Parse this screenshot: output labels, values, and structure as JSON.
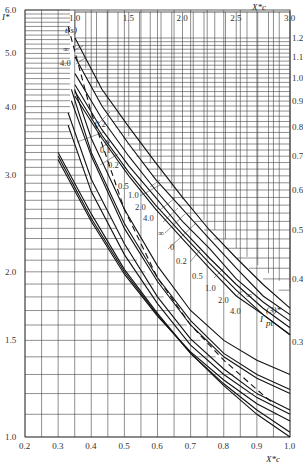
{
  "chart_data": {
    "type": "line",
    "title": "",
    "lower_left": {
      "xlabel": "X_c*",
      "ylabel": "I*",
      "xlim": [
        0.2,
        1.0
      ],
      "ylim": [
        1.0,
        6.0
      ],
      "xticks": [
        "0.2",
        "0.3",
        "0.4",
        "0.5",
        "0.6",
        "0.7",
        "0.8",
        "0.9",
        "1.0"
      ],
      "yticks": [
        "1.0",
        "1.5",
        "2.0",
        "3.0",
        "4.0",
        "5.0",
        "6.0"
      ],
      "yscale": "log",
      "series": [
        {
          "name": "0",
          "x": [
            0.3,
            0.4,
            0.5,
            0.6,
            0.7,
            0.8,
            0.9,
            1.0
          ],
          "values": [
            3.3,
            2.55,
            2.02,
            1.68,
            1.42,
            1.24,
            1.1,
            1.0
          ]
        },
        {
          "name": "0.1",
          "x": [
            0.3,
            0.4,
            0.5,
            0.6,
            0.7,
            0.8,
            0.9,
            1.0
          ],
          "values": [
            3.25,
            2.5,
            2.0,
            1.67,
            1.42,
            1.25,
            1.12,
            1.02
          ]
        },
        {
          "name": "0.2",
          "x": [
            0.3,
            0.4,
            0.5,
            0.6,
            0.7,
            0.8,
            0.9,
            1.0
          ],
          "values": [
            3.2,
            2.47,
            1.98,
            1.66,
            1.43,
            1.27,
            1.15,
            1.07
          ]
        },
        {
          "name": "0.5",
          "x": [
            0.33,
            0.4,
            0.5,
            0.6,
            0.7,
            0.8,
            0.9,
            1.0
          ],
          "values": [
            3.7,
            2.8,
            2.15,
            1.75,
            1.47,
            1.3,
            1.18,
            1.1
          ]
        },
        {
          "name": "1.0",
          "x": [
            0.33,
            0.4,
            0.5,
            0.6,
            0.7,
            0.8,
            0.9,
            1.0
          ],
          "values": [
            3.9,
            2.95,
            2.25,
            1.8,
            1.51,
            1.33,
            1.2,
            1.12
          ]
        },
        {
          "name": "2.0",
          "x": [
            0.34,
            0.4,
            0.5,
            0.6,
            0.7,
            0.8,
            0.9,
            1.0
          ],
          "values": [
            4.1,
            3.25,
            2.4,
            1.92,
            1.6,
            1.4,
            1.28,
            1.2
          ]
        },
        {
          "name": "4.0",
          "x": [
            0.34,
            0.4,
            0.5,
            0.6,
            0.7,
            0.8,
            0.9,
            1.0
          ],
          "values": [
            4.3,
            3.3,
            2.45,
            1.95,
            1.63,
            1.42,
            1.3,
            1.22
          ]
        },
        {
          "name": "∞",
          "x": [
            0.35,
            0.4,
            0.5,
            0.6,
            0.7,
            0.8,
            0.9,
            1.0
          ],
          "values": [
            4.3,
            3.5,
            2.6,
            2.05,
            1.7,
            1.5,
            1.38,
            1.3
          ]
        },
        {
          "name": "dashed",
          "style": "dashed",
          "x": [
            0.33,
            0.4,
            0.5,
            0.6,
            0.7,
            0.8,
            0.9,
            0.95
          ],
          "values": [
            5.6,
            3.9,
            2.6,
            1.95,
            1.6,
            1.38,
            1.22,
            1.15
          ]
        }
      ],
      "curve_labels": [
        "0.2",
        "0",
        "0.1",
        "0.2",
        "0.5",
        "1.0",
        "2.0",
        "4.0"
      ]
    },
    "upper_right": {
      "xlabel": "X_c*",
      "ylabel": "I_pt(3)*",
      "xlim": [
        1.0,
        3.0
      ],
      "ylim": [
        0.3,
        1.2
      ],
      "xticks": [
        "1.0",
        "1.5",
        "2.0",
        "2.5",
        "3.0"
      ],
      "yticks": [
        "0.3",
        "0.4",
        "0.5",
        "0.6",
        "0.7",
        "0.8",
        "0.9",
        "1.0",
        "1.1",
        "1.2"
      ],
      "yscale": "log",
      "series": [
        {
          "name": "∞",
          "x": [
            1.0,
            1.25,
            1.5,
            1.75,
            2.0,
            2.25,
            2.5,
            2.75,
            3.0
          ],
          "values": [
            1.2,
            0.95,
            0.8,
            0.68,
            0.58,
            0.5,
            0.44,
            0.39,
            0.35
          ]
        },
        {
          "name": "4.0",
          "x": [
            1.0,
            1.25,
            1.5,
            1.75,
            2.0,
            2.25,
            2.5,
            2.75,
            3.0
          ],
          "values": [
            1.1,
            0.88,
            0.74,
            0.63,
            0.55,
            0.48,
            0.42,
            0.37,
            0.34
          ]
        },
        {
          "name": "2.0",
          "x": [
            1.0,
            1.25,
            1.5,
            1.75,
            2.0,
            2.25,
            2.5,
            2.75,
            3.0
          ],
          "values": [
            1.02,
            0.83,
            0.7,
            0.6,
            0.52,
            0.46,
            0.4,
            0.36,
            0.33
          ]
        },
        {
          "name": "0",
          "x": [
            1.0,
            1.25,
            1.5,
            1.75,
            2.0,
            2.25,
            2.5,
            2.75,
            3.0
          ],
          "values": [
            0.97,
            0.79,
            0.67,
            0.58,
            0.5,
            0.44,
            0.39,
            0.35,
            0.32
          ]
        },
        {
          "name": "0.2",
          "x": [
            1.0,
            1.25,
            1.5,
            1.75,
            2.0,
            2.25,
            2.5,
            2.75,
            3.0
          ],
          "values": [
            0.94,
            0.77,
            0.65,
            0.56,
            0.49,
            0.43,
            0.38,
            0.34,
            0.31
          ]
        },
        {
          "name": "0.5",
          "x": [
            1.0,
            1.25,
            1.5,
            1.75,
            2.0,
            2.25,
            2.5,
            2.75,
            3.0
          ],
          "values": [
            0.92,
            0.76,
            0.64,
            0.55,
            0.48,
            0.42,
            0.37,
            0.34,
            0.31
          ]
        }
      ],
      "curve_labels": [
        "∞",
        "4.0",
        "∞",
        "0",
        "0.2",
        "0.5",
        "1.0",
        "2.0",
        "4.0",
        "∞"
      ]
    },
    "legend_title": "t(s)",
    "annotations": [
      "t(s)",
      "∞",
      "4.0",
      "I_pt(3)*",
      "X_c*"
    ]
  },
  "axes": {
    "left_label": "I*",
    "top_label": "X*c",
    "bottom_label": "X*c",
    "right_label_main": "I",
    "right_label_sup": "(3)*",
    "right_label_sub": "pt",
    "t_label": "t(s)"
  },
  "labels": {
    "top_inf": "∞",
    "top_4": "4.0",
    "l_02a": "0.2",
    "l_0": "0",
    "l_01": "0.1",
    "l_02b": "0.2",
    "l_05": "0.5",
    "l_10": "1.0",
    "l_20": "2.0",
    "l_40": "4.0",
    "r_inf": "∞",
    "r_0": "0",
    "r_02": "0.2",
    "r_05": "0.5",
    "r_10": "1.0",
    "r_20": "2.0",
    "r_40": "4.0",
    "r_inf2": "∞"
  }
}
